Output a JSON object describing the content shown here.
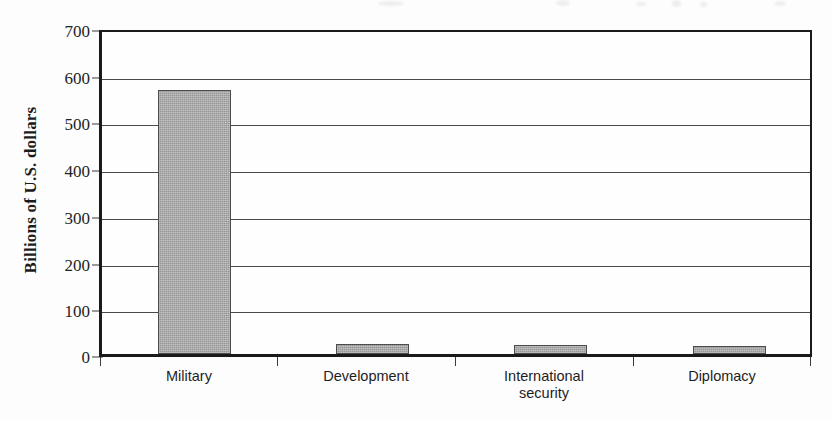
{
  "chart_data": {
    "type": "bar",
    "title": "",
    "xlabel": "",
    "ylabel": "Billions of U.S. dollars",
    "categories": [
      "Military",
      "Development",
      "International\nsecurity",
      "Diplomacy"
    ],
    "values": [
      575,
      21,
      19,
      17
    ],
    "ylim": [
      0,
      700
    ],
    "yticks": [
      0,
      100,
      200,
      300,
      400,
      500,
      600,
      700
    ],
    "ytick_labels": [
      "0",
      "100",
      "200",
      "300",
      "400",
      "500",
      "600",
      "700"
    ],
    "grid": "horizontal",
    "legend": "none",
    "bar_color": "#a9a9a9",
    "bar_edge_color": "#4c4c4c",
    "axis_color": "#1a1a1a",
    "gridline_color": "#4a4a4a",
    "background_color": "#fdfdfd"
  },
  "axis": {
    "y_title": "Billions of U.S. dollars",
    "ticks": [
      {
        "label": "700",
        "value": 700
      },
      {
        "label": "600",
        "value": 600
      },
      {
        "label": "500",
        "value": 500
      },
      {
        "label": "400",
        "value": 400
      },
      {
        "label": "300",
        "value": 300
      },
      {
        "label": "200",
        "value": 200
      },
      {
        "label": "100",
        "value": 100
      },
      {
        "label": "0",
        "value": 0
      }
    ]
  },
  "categories": [
    {
      "name": "military",
      "line1": "Military",
      "line2": ""
    },
    {
      "name": "development",
      "line1": "Development",
      "line2": ""
    },
    {
      "name": "international-security",
      "line1": "International",
      "line2": "security"
    },
    {
      "name": "diplomacy",
      "line1": "Diplomacy",
      "line2": ""
    }
  ]
}
